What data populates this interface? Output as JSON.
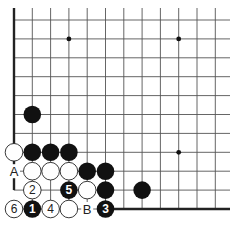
{
  "diagram": {
    "type": "go-board-fragment",
    "grid": {
      "columns": 12,
      "rows": 11,
      "origin_x": 14,
      "bottom_y": 209,
      "col_spacing": 18.3,
      "row_spacing": 18.9,
      "top_y_extent": 8,
      "right_x_extent": 230
    },
    "edges": {
      "left": {
        "col": 0,
        "from_row": 10,
        "to_row": 2
      },
      "left_short": {
        "col": 0,
        "from_row": 1.8,
        "to_row": 1
      },
      "bottom": {
        "row": 0,
        "from_col": 5,
        "to_x": 230
      }
    },
    "hoshi": [
      {
        "col": 3,
        "row": 9
      },
      {
        "col": 9,
        "row": 9
      },
      {
        "col": 9,
        "row": 3
      }
    ],
    "stones": [
      {
        "color": "black",
        "col": 1,
        "row": 5,
        "label": ""
      },
      {
        "color": "white",
        "col": 0,
        "row": 3,
        "label": ""
      },
      {
        "color": "black",
        "col": 1,
        "row": 3,
        "label": ""
      },
      {
        "color": "black",
        "col": 2,
        "row": 3,
        "label": ""
      },
      {
        "color": "black",
        "col": 3,
        "row": 3,
        "label": ""
      },
      {
        "color": "white",
        "col": 1,
        "row": 2,
        "label": ""
      },
      {
        "color": "white",
        "col": 2,
        "row": 2,
        "label": ""
      },
      {
        "color": "white",
        "col": 3,
        "row": 2,
        "label": ""
      },
      {
        "color": "black",
        "col": 4,
        "row": 2,
        "label": ""
      },
      {
        "color": "black",
        "col": 5,
        "row": 2,
        "label": ""
      },
      {
        "color": "white",
        "col": 1,
        "row": 1,
        "label": "2"
      },
      {
        "color": "black",
        "col": 3,
        "row": 1,
        "label": "5"
      },
      {
        "color": "white",
        "col": 4,
        "row": 1,
        "label": ""
      },
      {
        "color": "black",
        "col": 5,
        "row": 1,
        "label": ""
      },
      {
        "color": "black",
        "col": 7,
        "row": 1,
        "label": ""
      },
      {
        "color": "white",
        "col": 0,
        "row": 0,
        "label": "6"
      },
      {
        "color": "black",
        "col": 1,
        "row": 0,
        "label": "1"
      },
      {
        "color": "white",
        "col": 2,
        "row": 0,
        "label": "4"
      },
      {
        "color": "white",
        "col": 3,
        "row": 0,
        "label": ""
      },
      {
        "color": "black",
        "col": 5,
        "row": 0,
        "label": "3"
      }
    ],
    "marks": [
      {
        "text": "A",
        "col": 0,
        "row": 2
      },
      {
        "text": "B",
        "col": 4,
        "row": 0
      }
    ],
    "colors": {
      "black_stone": "#111111",
      "white_stone": "#ffffff",
      "line": "#555555",
      "edge": "#222222"
    }
  }
}
